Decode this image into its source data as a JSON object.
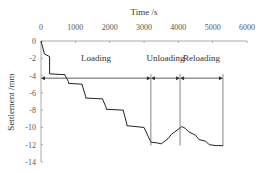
{
  "chart_data": {
    "type": "line",
    "title": "",
    "xlabel": "Time /s",
    "ylabel": "Settlement /mm",
    "xlim": [
      0,
      6000
    ],
    "ylim": [
      -14,
      0
    ],
    "xticks": [
      "0",
      "1000",
      "2000",
      "3000",
      "4000",
      "5000",
      "6000"
    ],
    "yticks": [
      "0",
      "-2",
      "-4",
      "-6",
      "-8",
      "-10",
      "-12",
      "-14"
    ],
    "x_axis_position": "top",
    "grid": false,
    "annotations": [
      {
        "text": "Loading",
        "x_range": [
          0,
          3200
        ]
      },
      {
        "text": "Unloading",
        "x_range": [
          3200,
          4050
        ]
      },
      {
        "text": "Reloading",
        "x_range": [
          4050,
          5300
        ]
      }
    ],
    "series": [
      {
        "name": "Settlement",
        "x": [
          0,
          100,
          100,
          250,
          250,
          700,
          700,
          800,
          800,
          1200,
          1200,
          1300,
          1300,
          1800,
          1800,
          1900,
          1900,
          2400,
          2400,
          2500,
          2500,
          3000,
          3200,
          3400,
          3500,
          3700,
          3800,
          4000,
          4100,
          4200,
          4300,
          4500,
          4600,
          4800,
          4900,
          5100,
          5300
        ],
        "y": [
          0,
          -1.5,
          -1.5,
          -1.8,
          -3.8,
          -3.9,
          -4.0,
          -4.7,
          -4.9,
          -5.0,
          -5.1,
          -6.4,
          -6.6,
          -6.7,
          -6.8,
          -7.7,
          -7.9,
          -8.0,
          -8.1,
          -9.6,
          -9.8,
          -10.0,
          -11.7,
          -11.8,
          -11.9,
          -11.3,
          -10.8,
          -10.2,
          -9.9,
          -10.1,
          -10.5,
          -10.9,
          -11.4,
          -11.6,
          -12.0,
          -12.1,
          -12.1
        ]
      }
    ]
  }
}
